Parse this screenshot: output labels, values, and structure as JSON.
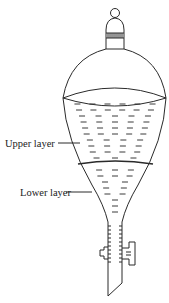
{
  "diagram": {
    "labels": {
      "upper_layer": "Upper layer",
      "lower_layer": "Lower layer"
    },
    "parts": [
      "stopper",
      "neck",
      "bulb",
      "upper-liquid-layer",
      "lower-liquid-layer",
      "layer-interface",
      "stem",
      "stopcock"
    ],
    "colors": {
      "line": "#2a2a2a",
      "background": "#ffffff"
    }
  }
}
